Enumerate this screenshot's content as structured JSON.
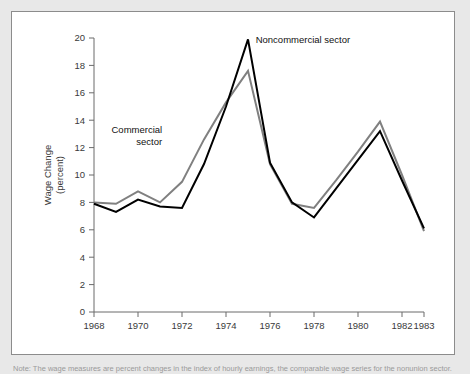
{
  "figure": {
    "background_color": "#e8e8e8",
    "panel_color": "#ffffff",
    "panel_border_color": "#8c8c8c"
  },
  "note": {
    "text": "Note:  The wage measures are percent changes in the index of hourly earnings, the comparable wage series for the nonunion sector."
  },
  "chart_data": {
    "type": "line",
    "title": "",
    "xlabel": "",
    "ylabel": "Wage Change (percent)",
    "ylabel_line1": "Wage Change",
    "ylabel_line2": "(percent)",
    "xlim": [
      1968,
      1983
    ],
    "ylim": [
      0,
      20
    ],
    "ytick_step": 2,
    "grid": false,
    "legend_position": "inline-annotation",
    "x": [
      1968,
      1969,
      1970,
      1971,
      1972,
      1973,
      1974,
      1975,
      1976,
      1977,
      1978,
      1979,
      1980,
      1981,
      1982,
      1983
    ],
    "xtick_labels": [
      "1968",
      "1970",
      "1972",
      "1974",
      "1976",
      "1978",
      "1980",
      "1982",
      "1983"
    ],
    "xtick_values": [
      1968,
      1970,
      1972,
      1974,
      1976,
      1978,
      1980,
      1982,
      1983
    ],
    "ytick_labels": [
      "0",
      "2",
      "4",
      "6",
      "8",
      "10",
      "12",
      "14",
      "16",
      "18",
      "20"
    ],
    "ytick_values": [
      0,
      2,
      4,
      6,
      8,
      10,
      12,
      14,
      16,
      18,
      20
    ],
    "series": [
      {
        "name": "Noncommercial sector",
        "color": "#000000",
        "width": 2.0,
        "label_x": 1975.35,
        "label_y": 19.6,
        "values": [
          7.9,
          7.3,
          8.2,
          7.7,
          7.6,
          10.8,
          15.0,
          19.9,
          10.9,
          8.0,
          6.9,
          9.0,
          11.1,
          13.2,
          9.6,
          6.1
        ]
      },
      {
        "name": "Commercial sector",
        "color": "#808080",
        "width": 2.0,
        "label_x": 1971.1,
        "label_y": 13.1,
        "label_line1": "Commercial",
        "label_line2": "sector",
        "values": [
          8.0,
          7.9,
          8.8,
          8.0,
          9.5,
          12.6,
          15.3,
          17.6,
          10.8,
          7.9,
          7.6,
          9.6,
          11.7,
          13.9,
          10.0,
          5.9
        ]
      }
    ]
  }
}
